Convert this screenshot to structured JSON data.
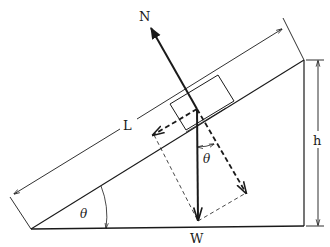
{
  "diagram": {
    "type": "inclined-plane free body diagram",
    "labels": {
      "normal_force": "N",
      "weight": "W",
      "length": "L",
      "height": "h",
      "angle_incline": "θ",
      "angle_weight": "θ"
    },
    "colors": {
      "line": "#1a1a1a",
      "background": "#ffffff"
    }
  }
}
